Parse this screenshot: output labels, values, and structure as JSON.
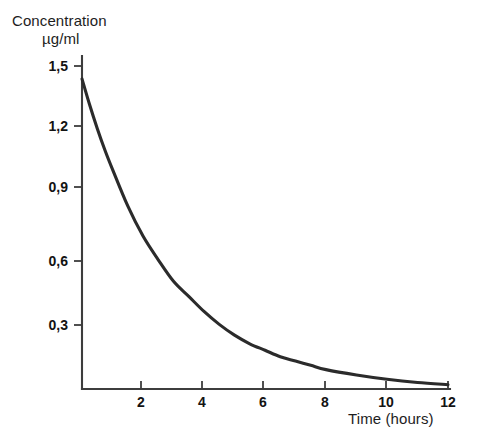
{
  "chart_data": {
    "type": "line",
    "title": "",
    "subtitle": "",
    "ylabel_line1": "Concentration",
    "ylabel_line2": "µg/ml",
    "xlabel": "Time (hours)",
    "xlim": [
      0,
      12
    ],
    "ylim": [
      0,
      1.5
    ],
    "grid": false,
    "legend": "none",
    "xticks": [
      2,
      4,
      6,
      8,
      10,
      12
    ],
    "xtick_labels": [
      "2",
      "4",
      "6",
      "8",
      "10",
      "12"
    ],
    "yticks": [
      0.3,
      0.6,
      0.9,
      1.2,
      1.5
    ],
    "ytick_labels": [
      "0,3",
      "0,6",
      "0,9",
      "1,2",
      "1,5"
    ],
    "decimal_separator": ",",
    "series": [
      {
        "name": "Plasma concentration",
        "x": [
          0,
          0.25,
          0.5,
          0.75,
          1,
          1.5,
          2,
          2.5,
          3,
          3.5,
          4,
          4.5,
          5,
          5.5,
          6,
          6.5,
          7,
          7.5,
          8,
          9,
          10,
          11,
          12
        ],
        "values": [
          1.44,
          1.32,
          1.21,
          1.11,
          1.02,
          0.85,
          0.71,
          0.6,
          0.5,
          0.43,
          0.36,
          0.3,
          0.25,
          0.21,
          0.18,
          0.15,
          0.13,
          0.11,
          0.09,
          0.065,
          0.045,
          0.03,
          0.02
        ]
      }
    ],
    "curve_model": "C(t) = 1.44 · e^(-0.355 t)",
    "colors": {
      "curve": "#2b2b2b",
      "axis": "#3d3d3d",
      "text": "#131313",
      "background": "#ffffff"
    }
  }
}
